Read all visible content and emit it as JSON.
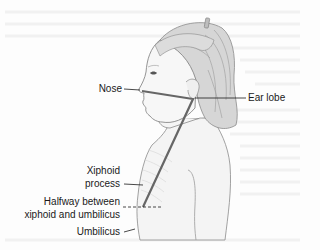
{
  "figure": {
    "labels": {
      "nose": "Nose",
      "ear_lobe": "Ear lobe",
      "xiphoid_line1": "Xiphoid",
      "xiphoid_line2": "process",
      "halfway_line1": "Halfway between",
      "halfway_line2": "xiphoid and umbilicus",
      "umbilicus": "Umbilicus"
    },
    "colors": {
      "background": "#fdfdfd",
      "measure_line": "#666666",
      "leader_line": "#1a1a1a",
      "skin_outline": "#8a8a8a",
      "hair_fill": "#d6d6d6",
      "hair_shade": "#9a9a9a"
    }
  }
}
